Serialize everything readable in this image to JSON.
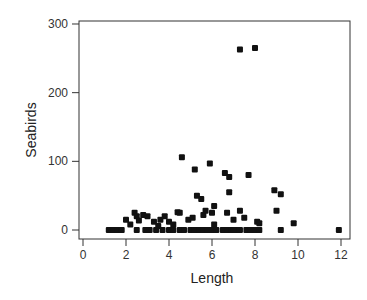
{
  "chart_data": {
    "type": "scatter",
    "title": "",
    "xlabel": "Length",
    "ylabel": "Seabirds",
    "xlim": [
      0,
      12
    ],
    "ylim": [
      0,
      300
    ],
    "xticks": [
      0,
      2,
      4,
      6,
      8,
      10,
      12
    ],
    "yticks": [
      0,
      100,
      200,
      300
    ],
    "grid": false,
    "legend": null,
    "marker": "square",
    "marker_color": "#111111",
    "points": [
      [
        1.2,
        0
      ],
      [
        1.4,
        0
      ],
      [
        1.6,
        0
      ],
      [
        1.8,
        0
      ],
      [
        2.5,
        0
      ],
      [
        2.9,
        0
      ],
      [
        3.1,
        0
      ],
      [
        3.4,
        0
      ],
      [
        3.7,
        0
      ],
      [
        4.0,
        0
      ],
      [
        4.2,
        0
      ],
      [
        4.5,
        0
      ],
      [
        4.7,
        0
      ],
      [
        5.0,
        0
      ],
      [
        5.2,
        0
      ],
      [
        5.4,
        0
      ],
      [
        5.6,
        0
      ],
      [
        5.8,
        0
      ],
      [
        6.0,
        0
      ],
      [
        6.2,
        0
      ],
      [
        6.5,
        0
      ],
      [
        6.7,
        0
      ],
      [
        6.9,
        0
      ],
      [
        7.0,
        0
      ],
      [
        7.1,
        0
      ],
      [
        7.3,
        0
      ],
      [
        7.6,
        0
      ],
      [
        7.8,
        0
      ],
      [
        8.0,
        0
      ],
      [
        8.2,
        0
      ],
      [
        9.2,
        0
      ],
      [
        11.9,
        0
      ],
      [
        2.0,
        15
      ],
      [
        2.2,
        8
      ],
      [
        2.4,
        25
      ],
      [
        2.5,
        20
      ],
      [
        2.6,
        14
      ],
      [
        2.8,
        22
      ],
      [
        3.0,
        20
      ],
      [
        3.3,
        12
      ],
      [
        3.5,
        6
      ],
      [
        3.6,
        15
      ],
      [
        3.8,
        20
      ],
      [
        4.0,
        12
      ],
      [
        4.2,
        8
      ],
      [
        4.4,
        26
      ],
      [
        4.5,
        25
      ],
      [
        4.6,
        106
      ],
      [
        4.9,
        15
      ],
      [
        5.1,
        18
      ],
      [
        5.2,
        88
      ],
      [
        5.3,
        50
      ],
      [
        5.5,
        45
      ],
      [
        5.6,
        22
      ],
      [
        5.7,
        28
      ],
      [
        5.9,
        97
      ],
      [
        6.0,
        25
      ],
      [
        6.1,
        35
      ],
      [
        6.1,
        8
      ],
      [
        6.6,
        83
      ],
      [
        6.7,
        25
      ],
      [
        6.8,
        77
      ],
      [
        6.8,
        55
      ],
      [
        7.0,
        15
      ],
      [
        7.3,
        263
      ],
      [
        7.3,
        28
      ],
      [
        7.5,
        18
      ],
      [
        7.7,
        80
      ],
      [
        8.0,
        265
      ],
      [
        8.1,
        12
      ],
      [
        8.2,
        10
      ],
      [
        8.9,
        58
      ],
      [
        9.0,
        28
      ],
      [
        9.2,
        52
      ],
      [
        9.8,
        10
      ]
    ]
  }
}
